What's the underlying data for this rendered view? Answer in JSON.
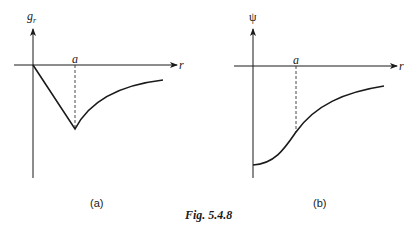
{
  "figure": {
    "caption": "Fig. 5.4.8",
    "panels": [
      {
        "id": "a",
        "label": "(a)",
        "y_axis_label": "g",
        "y_axis_subscript": "r",
        "x_axis_label": "r",
        "marker_label": "a",
        "description": "Linear decrease from origin to minimum at r=a, then curve rising asymptotically toward zero"
      },
      {
        "id": "b",
        "label": "(b)",
        "y_axis_label": "ψ",
        "x_axis_label": "r",
        "marker_label": "a",
        "description": "Curve starting at negative value at r=0, rising smoothly through r=a and approaching zero asymptotically"
      }
    ]
  },
  "colors": {
    "ink": "#1a1a1a",
    "background": "#ffffff"
  }
}
